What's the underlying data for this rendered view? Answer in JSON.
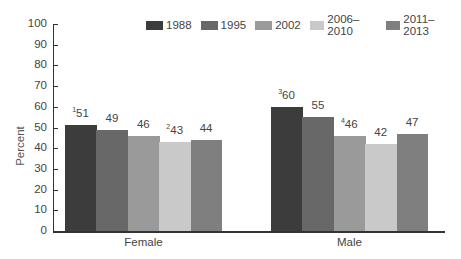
{
  "chart_data": {
    "type": "bar",
    "title": "",
    "xlabel": "",
    "ylabel": "Percent",
    "ylim": [
      0,
      100
    ],
    "yticks": [
      0,
      10,
      20,
      30,
      40,
      50,
      60,
      70,
      80,
      90,
      100
    ],
    "categories": [
      "Female",
      "Male"
    ],
    "series": [
      {
        "name": "1988",
        "color": "#3c3c3c",
        "values": [
          51,
          60
        ],
        "footnotes": [
          "1",
          "3"
        ]
      },
      {
        "name": "1995",
        "color": "#686868",
        "values": [
          49,
          55
        ],
        "footnotes": [
          "",
          ""
        ]
      },
      {
        "name": "2002",
        "color": "#9a9a9a",
        "values": [
          46,
          46
        ],
        "footnotes": [
          "",
          "4"
        ]
      },
      {
        "name": "2006–2010",
        "color": "#c9c9c9",
        "values": [
          43,
          42
        ],
        "footnotes": [
          "2",
          ""
        ]
      },
      {
        "name": "2011–2013",
        "color": "#7f7f7f",
        "values": [
          44,
          47
        ],
        "footnotes": [
          "",
          ""
        ]
      }
    ],
    "grid": false,
    "legend_position": "top-right"
  }
}
